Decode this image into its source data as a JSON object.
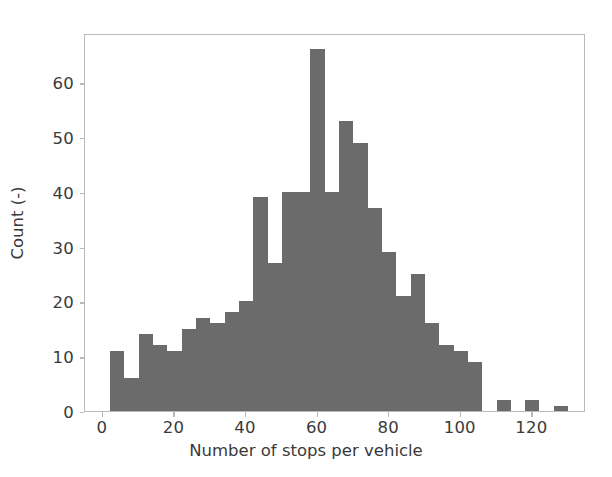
{
  "chart_data": {
    "type": "bar",
    "title": "",
    "xlabel": "Number of stops per vehicle",
    "ylabel": "Count (-)",
    "xlim": [
      -5,
      135
    ],
    "ylim": [
      0,
      69
    ],
    "grid": false,
    "legend": null,
    "bar_color": "#6b6b6b",
    "bin_width": 4,
    "bin_edges": [
      2,
      6,
      10,
      14,
      18,
      22,
      26,
      30,
      34,
      38,
      42,
      46,
      50,
      54,
      58,
      62,
      66,
      70,
      74,
      78,
      82,
      86,
      90,
      94,
      98,
      102,
      106,
      110,
      114,
      118,
      122,
      126,
      130
    ],
    "bin_centers": [
      4,
      8,
      12,
      16,
      20,
      24,
      28,
      32,
      36,
      40,
      44,
      48,
      52,
      56,
      60,
      64,
      68,
      72,
      76,
      80,
      84,
      88,
      92,
      96,
      100,
      104,
      108,
      112,
      116,
      120,
      124,
      128
    ],
    "values": [
      11,
      6,
      14,
      12,
      11,
      15,
      17,
      16,
      18,
      20,
      39,
      27,
      40,
      40,
      66,
      40,
      53,
      49,
      37,
      29,
      21,
      25,
      16,
      12,
      11,
      9,
      0,
      2,
      0,
      2,
      0,
      1
    ],
    "xticks": [
      0,
      20,
      40,
      60,
      80,
      100,
      120
    ],
    "xticklabels": [
      "0",
      "20",
      "40",
      "60",
      "80",
      "100",
      "120"
    ],
    "yticks": [
      0,
      10,
      20,
      30,
      40,
      50,
      60
    ],
    "yticklabels": [
      "0",
      "10",
      "20",
      "30",
      "40",
      "50",
      "60"
    ]
  }
}
